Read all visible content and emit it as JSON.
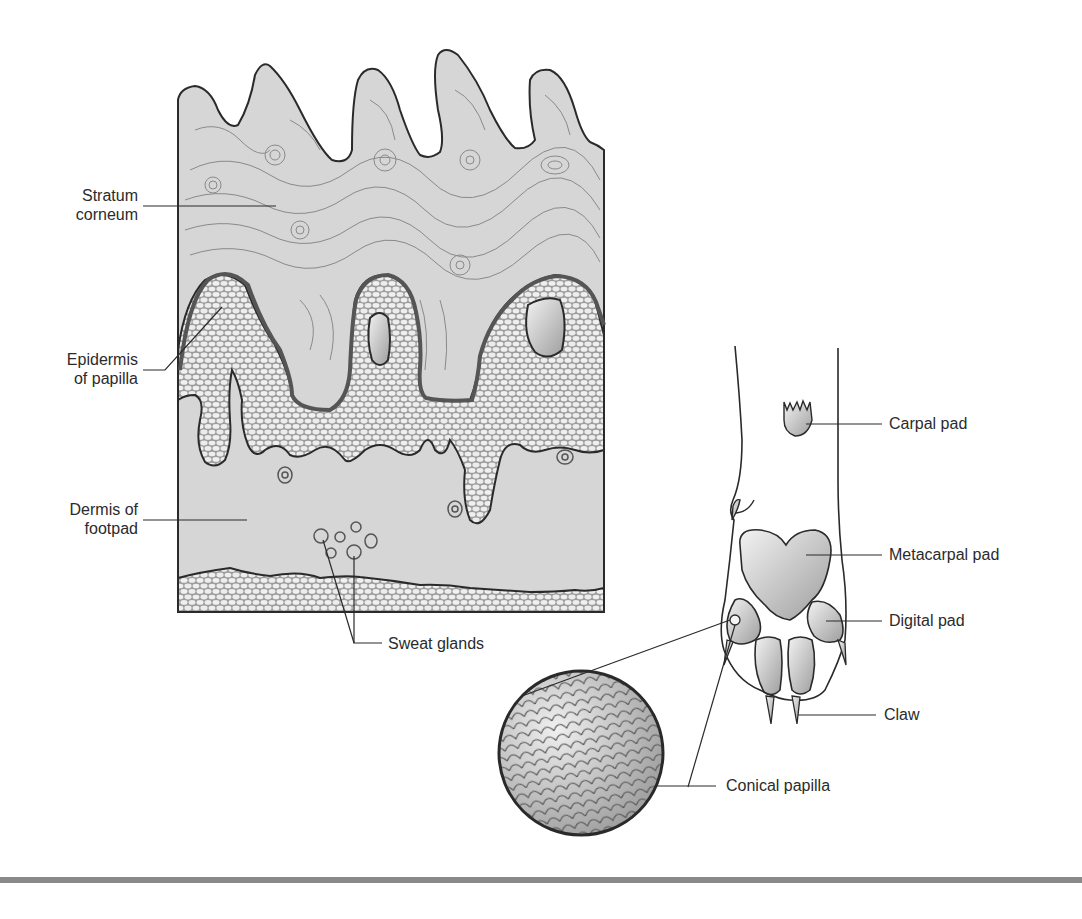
{
  "figure": {
    "left_panel": {
      "title": "Footpad skin cross-section",
      "labels": {
        "stratum_corneum": [
          "Stratum",
          "corneum"
        ],
        "epidermis_of_papilla": [
          "Epidermis",
          "of papilla"
        ],
        "dermis_of_footpad": [
          "Dermis of",
          "footpad"
        ],
        "sweat_glands": "Sweat glands"
      }
    },
    "right_panel": {
      "title": "Forelimb paw (palmar view)",
      "labels": {
        "carpal_pad": "Carpal pad",
        "metacarpal_pad": "Metacarpal pad",
        "digital_pad": "Digital pad",
        "claw": "Claw",
        "conical_papilla": "Conical papilla"
      }
    },
    "colors": {
      "stroke": "#2a2a2a",
      "corneum_fill": "#d4d4d4",
      "dermis_fill": "#c6c6c6",
      "cell_fill": "#efefef",
      "pad_light": "#e6e6e6",
      "pad_dark": "#a8a8a8",
      "rule": "#8a8a8a"
    }
  },
  "caption": {
    "text": ""
  }
}
